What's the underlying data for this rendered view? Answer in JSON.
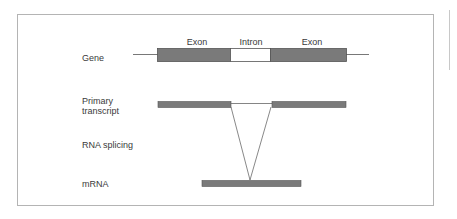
{
  "diagram": {
    "title": "RNA splicing",
    "row_labels": {
      "gene": "Gene",
      "primary_transcript": "Primary transcript",
      "rna_splicing": "RNA splicing",
      "mrna": "mRNA"
    },
    "segment_labels": {
      "exon1": "Exon",
      "intron": "Intron",
      "exon2": "Exon"
    },
    "colors": {
      "exon_fill": "#7a7a7a",
      "intron_fill": "#ffffff",
      "stroke": "#555555",
      "frame": "#b4b4b4",
      "text": "#3a3a3a"
    }
  }
}
